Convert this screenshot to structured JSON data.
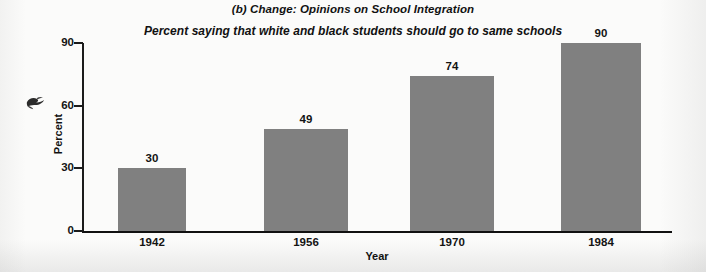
{
  "chart_data": {
    "type": "bar",
    "title": "(b) Change: Opinions on School Integration",
    "subtitle": "Percent saying that white and black students should go to same schools",
    "xlabel": "Year",
    "ylabel": "Percent",
    "categories": [
      "1942",
      "1956",
      "1970",
      "1984"
    ],
    "values": [
      30,
      49,
      74,
      90
    ],
    "value_labels": [
      "30",
      "49",
      "74",
      "90"
    ],
    "ylim": [
      0,
      90
    ],
    "yticks": [
      0,
      30,
      60,
      90
    ],
    "ytick_labels": [
      "0",
      "30",
      "60",
      "90"
    ],
    "grid": false,
    "legend": "none",
    "bar_color": "#808080",
    "axis_color": "#111111",
    "background_color": "#fbfbfa"
  },
  "artifacts": {
    "ink_smudge_label": "scan-ink-smudge"
  }
}
